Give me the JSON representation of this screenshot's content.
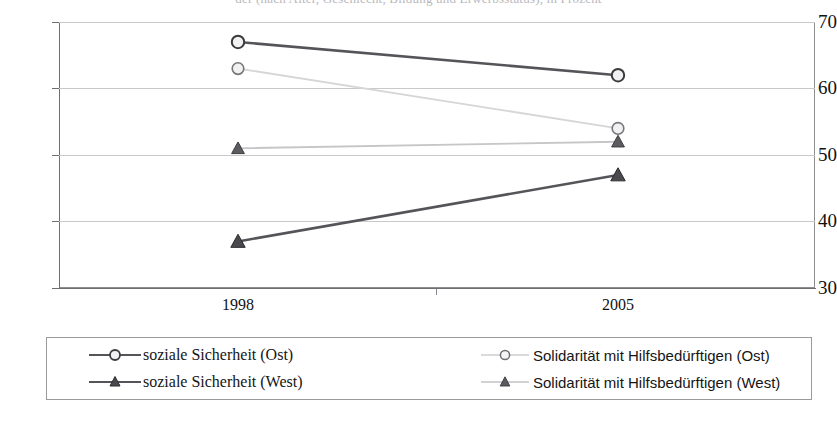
{
  "title_partial": "der (nach Alter, Geschlecht, Bildung und Erwerbsstatus), in Prozent",
  "axes": {
    "y_ticks": [
      "70",
      "60",
      "50",
      "40",
      "30"
    ],
    "x_ticks": [
      "1998",
      "2005"
    ],
    "ylim": [
      30,
      70
    ],
    "ystep": 10
  },
  "legend": {
    "items": [
      {
        "label": "soziale Sicherheit (Ost)",
        "marker": "circle-open",
        "color": "#555559",
        "column": "left",
        "row": 1
      },
      {
        "label": "soziale Sicherheit (West)",
        "marker": "triangle-filled",
        "color": "#555559",
        "column": "left",
        "row": 2
      },
      {
        "label": "Solidarität mit Hilfsbedürftigen  (Ost)",
        "marker": "circle-open",
        "color": "#d6d6d8",
        "column": "right",
        "row": 1
      },
      {
        "label": "Solidarität mit Hilfsbedürftigen  (West)",
        "marker": "triangle-filled",
        "color": "#c6c6c9",
        "column": "right",
        "row": 2
      }
    ]
  },
  "chart_data": {
    "type": "line",
    "title": "der (nach Alter, Geschlecht, Bildung und Erwerbsstatus), in Prozent",
    "xlabel": "",
    "ylabel": "",
    "categories": [
      "1998",
      "2005"
    ],
    "ylim": [
      30,
      70
    ],
    "grid": true,
    "legend_position": "bottom",
    "series": [
      {
        "name": "soziale Sicherheit (Ost)",
        "values": [
          67,
          62
        ],
        "color": "#555559",
        "marker": "circle-open"
      },
      {
        "name": "Solidarität mit Hilfsbedürftigen (Ost)",
        "values": [
          63,
          54
        ],
        "color": "#d6d6d8",
        "marker": "circle-open"
      },
      {
        "name": "soziale Sicherheit (West)",
        "values": [
          37,
          47
        ],
        "color": "#555559",
        "marker": "triangle-filled"
      },
      {
        "name": "Solidarität mit Hilfsbedürftigen (West)",
        "values": [
          51,
          52
        ],
        "color": "#c6c6c9",
        "marker": "triangle-filled"
      }
    ]
  }
}
